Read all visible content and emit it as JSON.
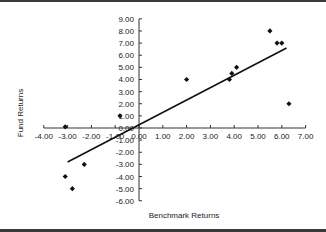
{
  "chart_data": {
    "type": "scatter",
    "title": "",
    "xlabel": "Benchmark Returns",
    "ylabel": "Fund Returns",
    "xlim": [
      -4,
      7
    ],
    "ylim": [
      -6,
      9
    ],
    "x_ticks": [
      "-4.00",
      "-3.00",
      "-2.00",
      "-1.00",
      "0.00",
      "1.00",
      "2.00",
      "3.00",
      "4.00",
      "5.00",
      "6.00",
      "7.00"
    ],
    "y_ticks": [
      "9.00",
      "8.00",
      "7.00",
      "6.00",
      "5.00",
      "4.00",
      "3.00",
      "2.00",
      "1.00",
      "0.00",
      "-1.00",
      "-2.00",
      "-3.00",
      "-4.00",
      "-5.00",
      "-6.00"
    ],
    "grid": false,
    "legend": null,
    "series": [
      {
        "name": "Fund vs Benchmark",
        "marker": "diamond",
        "points": [
          {
            "x": -3.1,
            "y": 0.1
          },
          {
            "x": -3.1,
            "y": -4.0
          },
          {
            "x": -2.8,
            "y": -5.0
          },
          {
            "x": -2.3,
            "y": -3.0
          },
          {
            "x": -0.8,
            "y": 1.0
          },
          {
            "x": 2.0,
            "y": 4.0
          },
          {
            "x": 3.8,
            "y": 4.0
          },
          {
            "x": 3.9,
            "y": 4.5
          },
          {
            "x": 4.1,
            "y": 5.0
          },
          {
            "x": 5.5,
            "y": 8.0
          },
          {
            "x": 5.8,
            "y": 7.0
          },
          {
            "x": 6.0,
            "y": 7.0
          },
          {
            "x": 6.3,
            "y": 2.0
          }
        ]
      }
    ],
    "trendline": {
      "type": "linear",
      "from": {
        "x": -3.0,
        "y": -2.8
      },
      "to": {
        "x": 6.2,
        "y": 6.6
      }
    }
  },
  "colors": {
    "marker": "#111111",
    "trendline": "#111111",
    "axis": "#333333",
    "border": "#3a3a3a"
  }
}
